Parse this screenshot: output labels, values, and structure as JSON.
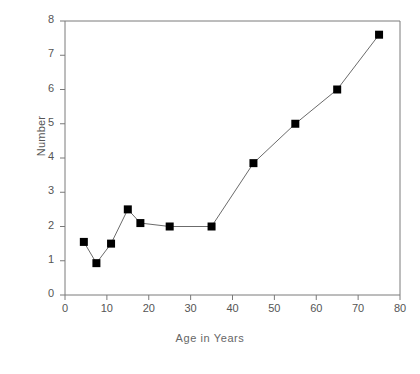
{
  "chart_data": {
    "type": "line",
    "title": "",
    "subtitle": "",
    "xlabel": "Age in Years",
    "ylabel": "Number",
    "xlim": [
      0,
      80
    ],
    "ylim": [
      0,
      8
    ],
    "xticks": [
      0,
      10,
      20,
      30,
      40,
      50,
      60,
      70,
      80
    ],
    "yticks": [
      0,
      1,
      2,
      3,
      4,
      5,
      6,
      7,
      8
    ],
    "xtick_labels": [
      "0",
      "10",
      "20",
      "30",
      "40",
      "50",
      "60",
      "70",
      "80"
    ],
    "ytick_labels": [
      "0",
      "1",
      "2",
      "3",
      "4",
      "5",
      "6",
      "7",
      "8"
    ],
    "grid": false,
    "legend": null,
    "marker": "square",
    "marker_color": "#000000",
    "line_color": "#6b6b6b",
    "series": [
      {
        "name": "Number",
        "x": [
          4.5,
          7.5,
          11,
          15,
          18,
          25,
          35,
          45,
          55,
          65,
          75
        ],
        "y": [
          1.55,
          0.93,
          1.5,
          2.5,
          2.1,
          2.0,
          2.0,
          3.85,
          5.0,
          6.0,
          7.6
        ]
      }
    ],
    "annotations": []
  },
  "axes": {
    "y_title": "Number",
    "x_title": "Age in Years"
  },
  "colors": {
    "background": "#ffffff",
    "frame": "#7a7a7a",
    "text": "#555555",
    "marker": "#000000",
    "line": "#6b6b6b"
  }
}
